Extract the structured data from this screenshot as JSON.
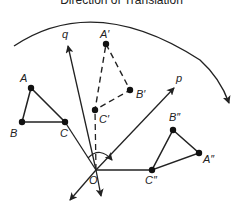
{
  "title": "Direction of Translation",
  "labels": {
    "A": "A",
    "B": "B",
    "C": "C",
    "A1": "A′",
    "B1": "B′",
    "C1": "C′",
    "A2": "A″",
    "B2": "B″",
    "C2": "C″",
    "p": "p",
    "q": "q",
    "O": "O"
  },
  "colors": {
    "stroke": "#222222",
    "background": "#ffffff"
  }
}
